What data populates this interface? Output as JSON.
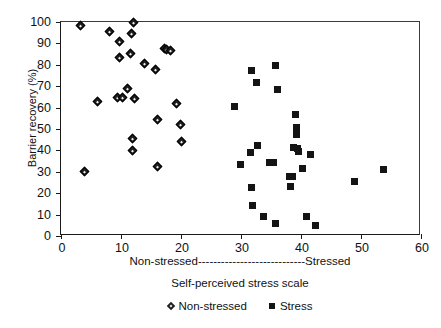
{
  "chart_data": {
    "type": "scatter",
    "title": "",
    "xlabel": "Self-perceived stress scale",
    "ylabel": "Barrier recovery (%)",
    "xlim": [
      0,
      60
    ],
    "ylim": [
      0,
      100
    ],
    "xticks": [
      0,
      10,
      20,
      30,
      40,
      50,
      60
    ],
    "yticks": [
      0,
      10,
      20,
      30,
      40,
      50,
      60,
      70,
      80,
      90,
      100
    ],
    "grid": false,
    "legend_position": "below-axis-center",
    "axis_band_label": "Non-stressed----------------------------Stressed",
    "axis_band_left": "Non-stressed",
    "axis_band_right": "Stressed",
    "series": [
      {
        "name": "Non-stressed",
        "marker": "diamond",
        "color": "#1f1f1f",
        "points": [
          [
            3.2,
            98.5
          ],
          [
            3.9,
            30.3
          ],
          [
            6.1,
            62.7
          ],
          [
            8.1,
            95.5
          ],
          [
            9.4,
            64.6
          ],
          [
            9.7,
            90.8
          ],
          [
            9.8,
            83.3
          ],
          [
            10.3,
            64.6
          ],
          [
            11.0,
            69.0
          ],
          [
            11.6,
            85.2
          ],
          [
            11.8,
            94.7
          ],
          [
            11.9,
            45.7
          ],
          [
            11.9,
            40.0
          ],
          [
            12.0,
            100.0
          ],
          [
            12.3,
            64.2
          ],
          [
            13.9,
            80.8
          ],
          [
            15.8,
            77.9
          ],
          [
            16.0,
            54.4
          ],
          [
            16.1,
            32.3
          ],
          [
            17.3,
            87.5
          ],
          [
            17.6,
            87.3
          ],
          [
            18.2,
            86.5
          ],
          [
            19.2,
            61.8
          ],
          [
            19.9,
            52.3
          ],
          [
            20.1,
            44.1
          ]
        ]
      },
      {
        "name": "Stress",
        "marker": "square",
        "color": "#141414",
        "points": [
          [
            28.9,
            60.6
          ],
          [
            29.9,
            33.5
          ],
          [
            31.6,
            38.8
          ],
          [
            31.7,
            77.2
          ],
          [
            31.8,
            22.6
          ],
          [
            31.9,
            14.1
          ],
          [
            32.6,
            71.9
          ],
          [
            32.8,
            42.2
          ],
          [
            33.8,
            9.3
          ],
          [
            34.8,
            34.5
          ],
          [
            35.4,
            34.5
          ],
          [
            35.7,
            79.6
          ],
          [
            35.8,
            5.9
          ],
          [
            36.0,
            68.6
          ],
          [
            38.1,
            27.7
          ],
          [
            38.3,
            23.2
          ],
          [
            38.6,
            27.7
          ],
          [
            38.8,
            41.4
          ],
          [
            39.0,
            56.9
          ],
          [
            39.2,
            47.3
          ],
          [
            39.3,
            50.8
          ],
          [
            39.4,
            41.1
          ],
          [
            39.6,
            39.6
          ],
          [
            40.2,
            31.5
          ],
          [
            40.9,
            8.9
          ],
          [
            41.6,
            37.9
          ],
          [
            42.4,
            4.8
          ],
          [
            48.9,
            25.6
          ],
          [
            53.7,
            31.1
          ]
        ]
      }
    ]
  },
  "legend": {
    "items": [
      {
        "label": "Non-stressed",
        "marker": "diamond-marker"
      },
      {
        "label": "Stress",
        "marker": "square-marker"
      }
    ]
  }
}
